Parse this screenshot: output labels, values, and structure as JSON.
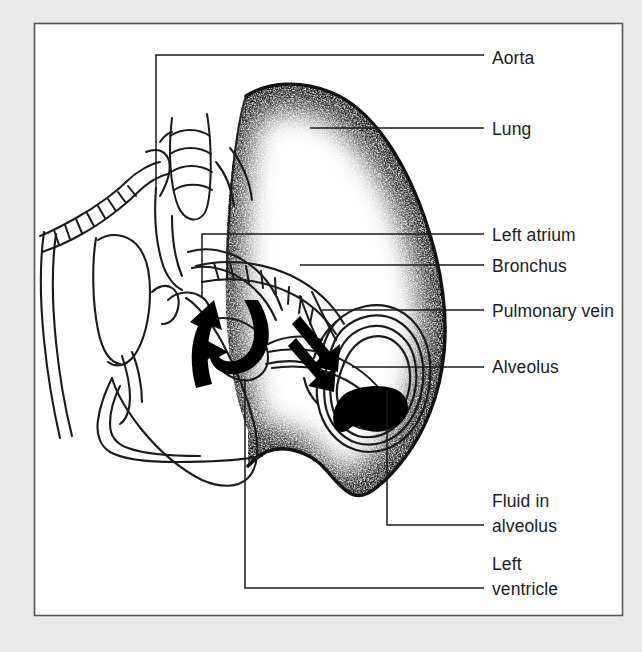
{
  "figure": {
    "kind": "anatomical-diagram",
    "frame": {
      "mat_color": "#e9e9e9",
      "page_color": "#ffffff",
      "border_color": "#555555"
    },
    "ink_color": "#1a1a1a",
    "fluid_color": "#000000",
    "arrow_color": "#000000"
  },
  "labels": [
    {
      "id": "aorta",
      "text": "Aorta",
      "lines": [
        "Aorta"
      ],
      "x": 492,
      "y": 64
    },
    {
      "id": "lung",
      "text": "Lung",
      "lines": [
        "Lung"
      ],
      "x": 492,
      "y": 135
    },
    {
      "id": "left-atrium",
      "text": "Left atrium",
      "lines": [
        "Left atrium"
      ],
      "x": 492,
      "y": 241
    },
    {
      "id": "bronchus",
      "text": "Bronchus",
      "lines": [
        "Bronchus"
      ],
      "x": 492,
      "y": 272
    },
    {
      "id": "pulmonary-vein",
      "text": "Pulmonary vein",
      "lines": [
        "Pulmonary vein"
      ],
      "x": 492,
      "y": 317
    },
    {
      "id": "alveolus",
      "text": "Alveolus",
      "lines": [
        "Alveolus"
      ],
      "x": 492,
      "y": 373
    },
    {
      "id": "fluid-in-alveolus",
      "text": "Fluid in alveolus",
      "lines": [
        "Fluid in",
        "alveolus"
      ],
      "x": 492,
      "y": 507
    },
    {
      "id": "left-ventricle",
      "text": "Left ventricle",
      "lines": [
        "Left",
        "ventricle"
      ],
      "x": 492,
      "y": 570
    }
  ],
  "leaders": [
    {
      "id": "leader-aorta",
      "path": "M 484 55 L 156 55 L 156 188"
    },
    {
      "id": "leader-lung",
      "path": "M 484 128 L 310 128"
    },
    {
      "id": "leader-left-atrium",
      "path": "M 484 234 L 202 234 L 202 296"
    },
    {
      "id": "leader-bronchus",
      "path": "M 484 265 L 300 265"
    },
    {
      "id": "leader-pulmonary-vein",
      "path": "M 484 310 L 322 310"
    },
    {
      "id": "leader-alveolus",
      "path": "M 484 367 L 352 367"
    },
    {
      "id": "leader-fluid-in-alveolus",
      "path": "M 484 525 L 387 525 L 387 390"
    },
    {
      "id": "leader-left-ventricle",
      "path": "M 484 588 L 245 588 L 245 380"
    }
  ],
  "structures": [
    {
      "id": "trachea",
      "name": "trachea-with-cartilage-rings"
    },
    {
      "id": "lung-body",
      "name": "stippled-lung"
    },
    {
      "id": "heart-outline",
      "name": "heart-chambers"
    },
    {
      "id": "bronchial-tree",
      "name": "ringed-bronchi"
    },
    {
      "id": "alveolus-sac",
      "name": "alveolus-with-fluid"
    },
    {
      "id": "flow-arrow-1",
      "name": "blood-flow-arrow-up"
    },
    {
      "id": "flow-arrow-2",
      "name": "blood-flow-arrow-down"
    },
    {
      "id": "flow-arrow-3",
      "name": "fluid-leak-arrow"
    }
  ]
}
